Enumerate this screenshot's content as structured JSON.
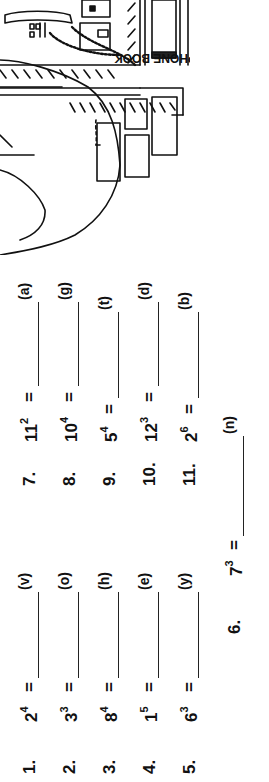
{
  "worksheet": {
    "problems": [
      {
        "num": "1.",
        "base": "2",
        "exp": "4",
        "eq": "=",
        "code": "(v)"
      },
      {
        "num": "2.",
        "base": "3",
        "exp": "3",
        "eq": "=",
        "code": "(o)"
      },
      {
        "num": "3.",
        "base": "8",
        "exp": "4",
        "eq": "=",
        "code": "(h)"
      },
      {
        "num": "4.",
        "base": "1",
        "exp": "5",
        "eq": "=",
        "code": "(e)"
      },
      {
        "num": "5.",
        "base": "6",
        "exp": "3",
        "eq": "=",
        "code": "(y)"
      },
      {
        "num": "6.",
        "base": "7",
        "exp": "3",
        "eq": "=",
        "code": "(n)"
      },
      {
        "num": "7.",
        "base": "11",
        "exp": "2",
        "eq": "=",
        "code": "(a)"
      },
      {
        "num": "8.",
        "base": "10",
        "exp": "4",
        "eq": "=",
        "code": "(g)"
      },
      {
        "num": "9.",
        "base": "5",
        "exp": "4",
        "eq": "=",
        "code": "(t)"
      },
      {
        "num": "10.",
        "base": "12",
        "exp": "3",
        "eq": "=",
        "code": "(d)"
      },
      {
        "num": "11.",
        "base": "2",
        "exp": "6",
        "eq": "=",
        "code": "(b)"
      }
    ]
  },
  "illustration": {
    "phone_book_label": "PHONE BOOK"
  },
  "colors": {
    "ink": "#111111",
    "paper": "#ffffff"
  }
}
